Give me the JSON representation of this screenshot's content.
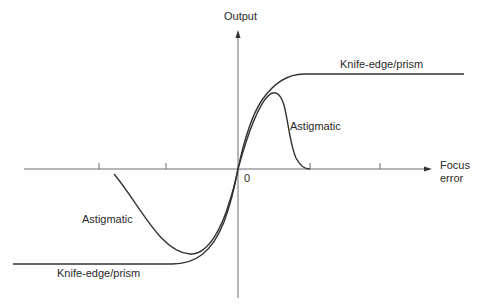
{
  "diagram": {
    "y_axis_label": "Output",
    "x_axis_label_line1": "Focus",
    "x_axis_label_line2": "error",
    "origin_label": "0",
    "curves": [
      {
        "name": "Knife-edge/prism",
        "label_top": "Knife-edge/prism",
        "label_bottom": "Knife-edge/prism"
      },
      {
        "name": "Astigmatic",
        "label_top": "Astigmatic",
        "label_bottom": "Astigmatic"
      }
    ],
    "colors": {
      "axis": "#6f6f6f",
      "curve": "#333333",
      "text": "#2a2a2a"
    }
  }
}
